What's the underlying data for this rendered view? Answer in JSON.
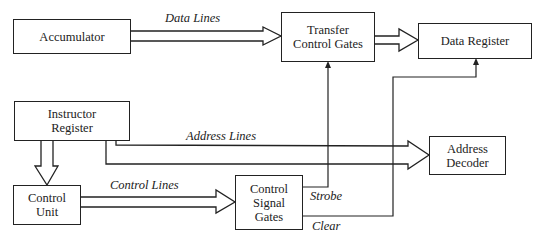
{
  "diagram": {
    "boxes": {
      "accumulator": {
        "label": "Accumulator"
      },
      "transfer_control_gates": {
        "line1": "Transfer",
        "line2": "Control Gates"
      },
      "data_register": {
        "label": "Data Register"
      },
      "instructor_register": {
        "line1": "Instructor",
        "line2": "Register"
      },
      "address_decoder": {
        "line1": "Address",
        "line2": "Decoder"
      },
      "control_unit": {
        "line1": "Control",
        "line2": "Unit"
      },
      "control_signal_gates": {
        "line1": "Control",
        "line2": "Signal",
        "line3": "Gates"
      }
    },
    "connections": {
      "data_lines": "Data Lines",
      "address_lines": "Address Lines",
      "control_lines": "Control Lines",
      "strobe": "Strobe",
      "clear": "Clear"
    },
    "colors": {
      "stroke": "#222222",
      "background": "#ffffff"
    }
  }
}
